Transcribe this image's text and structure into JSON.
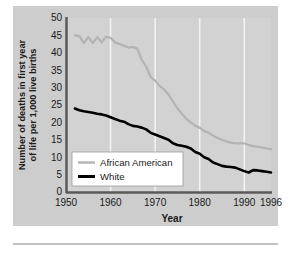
{
  "figure": {
    "background_color": "#ffffff",
    "plate_color": "#cdcdcd",
    "axis_color": "#555555",
    "gridline_color": "#f2f2f2"
  },
  "chart_data": {
    "type": "line",
    "title": "",
    "xlabel": "Year",
    "ylabel": "Number of deaths in first year of life per 1,000 live births",
    "xlim": [
      1950,
      1996
    ],
    "ylim": [
      0,
      50
    ],
    "xticks": [
      1950,
      1960,
      1970,
      1980,
      1990,
      1996
    ],
    "yticks": [
      0,
      5,
      10,
      15,
      20,
      25,
      30,
      35,
      40,
      45,
      50
    ],
    "grid": "vertical gridlines at 1960, 1970, 1980, 1990",
    "legend_position": "lower left inside plot",
    "series": [
      {
        "name": "African American",
        "color": "#b3b3b3",
        "x": [
          1952,
          1953,
          1954,
          1955,
          1956,
          1957,
          1958,
          1959,
          1960,
          1961,
          1962,
          1963,
          1964,
          1965,
          1966,
          1967,
          1968,
          1969,
          1970,
          1971,
          1972,
          1973,
          1974,
          1975,
          1976,
          1977,
          1978,
          1979,
          1980,
          1981,
          1982,
          1983,
          1984,
          1985,
          1986,
          1987,
          1988,
          1989,
          1990,
          1991,
          1992,
          1993,
          1994,
          1995,
          1996
        ],
        "values": [
          45.0,
          44.8,
          42.8,
          44.5,
          42.8,
          44.5,
          43.0,
          44.6,
          44.3,
          43.0,
          42.5,
          42.0,
          41.5,
          41.7,
          41.2,
          38.0,
          36.0,
          33.0,
          32.0,
          30.5,
          29.5,
          28.0,
          26.0,
          24.0,
          22.5,
          21.0,
          20.0,
          19.0,
          18.5,
          17.5,
          17.0,
          16.2,
          15.5,
          15.0,
          14.5,
          14.2,
          14.0,
          14.0,
          14.0,
          13.5,
          13.2,
          13.0,
          12.8,
          12.5,
          12.3
        ]
      },
      {
        "name": "White",
        "color": "#000000",
        "x": [
          1952,
          1953,
          1954,
          1955,
          1956,
          1957,
          1958,
          1959,
          1960,
          1961,
          1962,
          1963,
          1964,
          1965,
          1966,
          1967,
          1968,
          1969,
          1970,
          1971,
          1972,
          1973,
          1974,
          1975,
          1976,
          1977,
          1978,
          1979,
          1980,
          1981,
          1982,
          1983,
          1984,
          1985,
          1986,
          1987,
          1988,
          1989,
          1990,
          1991,
          1992,
          1993,
          1994,
          1995,
          1996
        ],
        "values": [
          24.0,
          23.5,
          23.2,
          23.0,
          22.8,
          22.5,
          22.3,
          22.0,
          21.5,
          21.0,
          20.5,
          20.2,
          19.5,
          19.0,
          18.8,
          18.5,
          18.0,
          17.0,
          16.5,
          16.0,
          15.5,
          15.0,
          14.0,
          13.5,
          13.3,
          13.0,
          12.5,
          11.5,
          11.0,
          10.0,
          9.5,
          8.5,
          8.0,
          7.5,
          7.3,
          7.2,
          7.0,
          6.5,
          6.0,
          5.6,
          6.3,
          6.2,
          6.0,
          5.8,
          5.6
        ]
      }
    ]
  },
  "axis": {
    "ylabel": "Number of deaths in first year of life per 1,000 live births",
    "xlabel": "Year",
    "yticks": [
      "50",
      "45",
      "40",
      "35",
      "30",
      "25",
      "20",
      "15",
      "10",
      "5",
      "0"
    ],
    "xticks": [
      "1950",
      "1960",
      "1970",
      "1980",
      "1990",
      "1996"
    ]
  },
  "legend": {
    "entries": [
      {
        "label": "African American",
        "color": "#b3b3b3"
      },
      {
        "label": "White",
        "color": "#000000"
      }
    ]
  }
}
